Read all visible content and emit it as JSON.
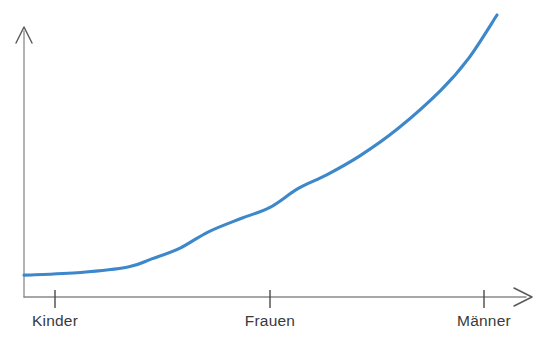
{
  "chart_data": {
    "type": "line",
    "title": "",
    "subtitle": "",
    "xlabel": "",
    "ylabel": "",
    "grid": false,
    "legend": null,
    "axis_style": "arrow-axes",
    "categories": [
      "Kinder",
      "Frauen",
      "Männer"
    ],
    "category_positions": [
      0.0,
      0.52,
      1.0
    ],
    "series": [
      {
        "name": "Kurve",
        "color": "#3d87cb",
        "x": [
          0.0,
          0.12,
          0.22,
          0.27,
          0.33,
          0.39,
          0.46,
          0.52,
          0.58,
          0.64,
          0.71,
          0.79,
          0.88,
          0.94,
          1.0
        ],
        "values": [
          0.04,
          0.05,
          0.07,
          0.1,
          0.14,
          0.2,
          0.25,
          0.29,
          0.36,
          0.41,
          0.48,
          0.58,
          0.72,
          0.84,
          1.0
        ]
      }
    ],
    "xlim": [
      0,
      1
    ],
    "ylim": [
      0,
      1
    ],
    "annotations": []
  },
  "axes": {
    "x_axis": {
      "name": "x-axis",
      "arrow": true,
      "color": "#8a8a8a"
    },
    "y_axis": {
      "name": "y-axis",
      "arrow": true,
      "color": "#8a8a8a"
    },
    "ticks": [
      {
        "label": "Kinder",
        "x": 55
      },
      {
        "label": "Frauen",
        "x": 270
      },
      {
        "label": "Männer",
        "x": 484
      }
    ]
  },
  "colors": {
    "curve": "#3d87cb",
    "axis": "#8a8a8a",
    "tick": "#4a4a4a",
    "label_text": "#3a3a3a",
    "background": "#ffffff"
  }
}
